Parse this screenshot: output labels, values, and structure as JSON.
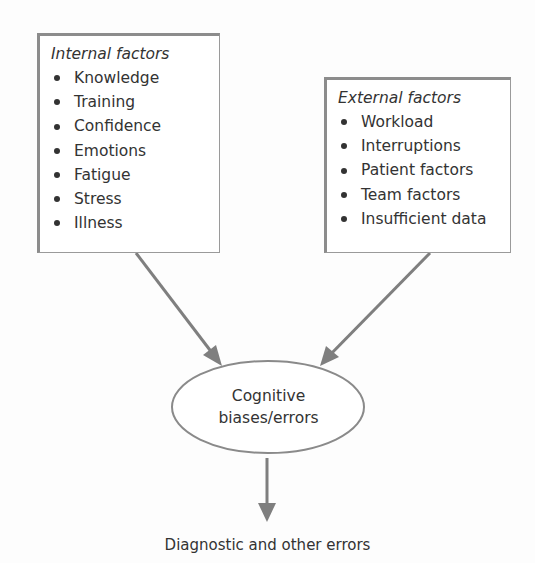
{
  "diagram": {
    "internal_factors": {
      "title": "Internal factors",
      "items": [
        "Knowledge",
        "Training",
        "Confidence",
        "Emotions",
        "Fatigue",
        "Stress",
        "Illness"
      ]
    },
    "external_factors": {
      "title": "External factors",
      "items": [
        "Workload",
        "Interruptions",
        "Patient factors",
        "Team factors",
        "Insufficient data"
      ]
    },
    "center_node": {
      "line1": "Cognitive",
      "line2": "biases/errors"
    },
    "outcome": "Diagnostic and other errors",
    "colors": {
      "border": "#8c8c8c",
      "arrow": "#7f7f7f",
      "text": "#333333",
      "background": "#fdfdfd"
    }
  }
}
